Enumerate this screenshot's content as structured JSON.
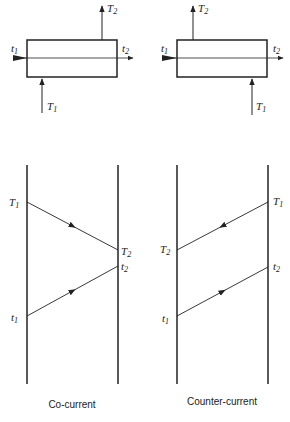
{
  "panels": [
    {
      "caption": "Co-current",
      "top": {
        "in_cold": "t",
        "in_cold_sub": "1",
        "out_cold": "t",
        "out_cold_sub": "2",
        "in_hot": "T",
        "in_hot_sub": "1",
        "out_hot": "T",
        "out_hot_sub": "2"
      },
      "profile": {
        "hot_start": "T",
        "hot_start_sub": "1",
        "hot_end": "T",
        "hot_end_sub": "2",
        "cold_start": "t",
        "cold_start_sub": "1",
        "cold_end": "t",
        "cold_end_sub": "2"
      }
    },
    {
      "caption": "Counter-current",
      "top": {
        "in_cold": "t",
        "in_cold_sub": "1",
        "out_cold": "t",
        "out_cold_sub": "2",
        "in_hot": "T",
        "in_hot_sub": "1",
        "out_hot": "T",
        "out_hot_sub": "2"
      },
      "profile": {
        "hot_start": "T",
        "hot_start_sub": "1",
        "hot_end": "T",
        "hot_end_sub": "2",
        "cold_start": "t",
        "cold_start_sub": "1",
        "cold_end": "t",
        "cold_end_sub": "2"
      }
    }
  ],
  "colors": {
    "line": "#222222"
  }
}
